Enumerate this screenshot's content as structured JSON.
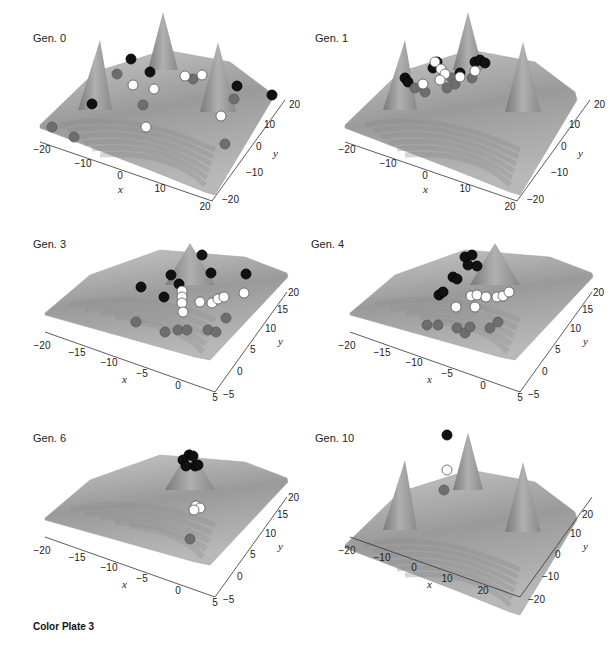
{
  "caption": "Color Plate 3",
  "panels": [
    {
      "title": "Gen. 0",
      "x_ticks": [
        "-20",
        "-10",
        "0",
        "10",
        "20"
      ],
      "y_ticks": [
        "-20",
        "-10",
        "0",
        "10",
        "20"
      ],
      "xlabel": "x",
      "ylabel": "y",
      "surface": "four-peak"
    },
    {
      "title": "Gen. 1",
      "x_ticks": [
        "-20",
        "-10",
        "0",
        "10",
        "20"
      ],
      "y_ticks": [
        "-20",
        "-10",
        "0",
        "10",
        "20"
      ],
      "xlabel": "x",
      "ylabel": "y",
      "surface": "four-peak"
    },
    {
      "title": "Gen. 3",
      "x_ticks": [
        "-20",
        "-15",
        "-10",
        "-5",
        "0",
        "5"
      ],
      "y_ticks": [
        "-5",
        "0",
        "5",
        "10",
        "15",
        "20"
      ],
      "xlabel": "x",
      "ylabel": "y",
      "surface": "zoomed-peak"
    },
    {
      "title": "Gen. 4",
      "x_ticks": [
        "-20",
        "-15",
        "-10",
        "-5",
        "0",
        "5"
      ],
      "y_ticks": [
        "-5",
        "0",
        "5",
        "10",
        "15",
        "20"
      ],
      "xlabel": "x",
      "ylabel": "y",
      "surface": "zoomed-peak"
    },
    {
      "title": "Gen. 6",
      "x_ticks": [
        "-20",
        "-15",
        "-10",
        "-5",
        "0",
        "5"
      ],
      "y_ticks": [
        "-5",
        "0",
        "5",
        "10",
        "15",
        "20"
      ],
      "xlabel": "x",
      "ylabel": "y",
      "surface": "zoomed-peak"
    },
    {
      "title": "Gen. 10",
      "x_ticks": [
        "-20",
        "-10",
        "0",
        "10",
        "20"
      ],
      "y_ticks": [
        "-20",
        "-10",
        "0",
        "10",
        "20"
      ],
      "xlabel": "x",
      "ylabel": "y",
      "surface": "four-peak"
    }
  ],
  "chart_data": [
    {
      "type": "surface-3d",
      "title": "Gen. 0",
      "xlabel": "x",
      "ylabel": "y",
      "xlim": [
        -20,
        20
      ],
      "ylim": [
        -20,
        20
      ],
      "x_ticks": [
        -20,
        -10,
        0,
        10,
        20
      ],
      "y_ticks": [
        -20,
        -10,
        0,
        10,
        20
      ],
      "series": [
        {
          "name": "black",
          "color": "#111111",
          "count": 6
        },
        {
          "name": "white",
          "color": "#ffffff",
          "count": 7
        },
        {
          "name": "gray",
          "color": "#6e6e6e",
          "count": 8
        }
      ]
    },
    {
      "type": "surface-3d",
      "title": "Gen. 1",
      "xlabel": "x",
      "ylabel": "y",
      "xlim": [
        -20,
        20
      ],
      "ylim": [
        -20,
        20
      ],
      "x_ticks": [
        -20,
        -10,
        0,
        10,
        20
      ],
      "y_ticks": [
        -20,
        -10,
        0,
        10,
        20
      ],
      "series": [
        {
          "name": "black",
          "color": "#111111",
          "count": 8
        },
        {
          "name": "white",
          "color": "#ffffff",
          "count": 8
        },
        {
          "name": "gray",
          "color": "#6e6e6e",
          "count": 6
        }
      ]
    },
    {
      "type": "surface-3d",
      "title": "Gen. 3",
      "xlabel": "x",
      "ylabel": "y",
      "xlim": [
        -20,
        5
      ],
      "ylim": [
        -5,
        20
      ],
      "x_ticks": [
        -20,
        -15,
        -10,
        -5,
        0,
        5
      ],
      "y_ticks": [
        -5,
        0,
        5,
        10,
        15,
        20
      ],
      "series": [
        {
          "name": "black",
          "color": "#111111",
          "count": 7
        },
        {
          "name": "white",
          "color": "#ffffff",
          "count": 9
        },
        {
          "name": "gray",
          "color": "#6e6e6e",
          "count": 8
        }
      ]
    },
    {
      "type": "surface-3d",
      "title": "Gen. 4",
      "xlabel": "x",
      "ylabel": "y",
      "xlim": [
        -20,
        5
      ],
      "ylim": [
        -5,
        20
      ],
      "x_ticks": [
        -20,
        -15,
        -10,
        -5,
        0,
        5
      ],
      "y_ticks": [
        -5,
        0,
        5,
        10,
        15,
        20
      ],
      "series": [
        {
          "name": "black",
          "color": "#111111",
          "count": 9
        },
        {
          "name": "white",
          "color": "#ffffff",
          "count": 9
        },
        {
          "name": "gray",
          "color": "#6e6e6e",
          "count": 8
        }
      ]
    },
    {
      "type": "surface-3d",
      "title": "Gen. 6",
      "xlabel": "x",
      "ylabel": "y",
      "xlim": [
        -20,
        5
      ],
      "ylim": [
        -5,
        20
      ],
      "x_ticks": [
        -20,
        -15,
        -10,
        -5,
        0,
        5
      ],
      "y_ticks": [
        -5,
        0,
        5,
        10,
        15,
        20
      ],
      "series": [
        {
          "name": "black",
          "color": "#111111",
          "count": 6
        },
        {
          "name": "white",
          "color": "#ffffff",
          "count": 3
        },
        {
          "name": "gray",
          "color": "#6e6e6e",
          "count": 1
        }
      ]
    },
    {
      "type": "surface-3d",
      "title": "Gen. 10",
      "xlabel": "x",
      "ylabel": "y",
      "xlim": [
        -20,
        20
      ],
      "ylim": [
        -20,
        20
      ],
      "x_ticks": [
        -20,
        -10,
        0,
        10,
        20
      ],
      "y_ticks": [
        -20,
        -10,
        0,
        10,
        20
      ],
      "series": [
        {
          "name": "black",
          "color": "#111111",
          "count": 1
        },
        {
          "name": "white",
          "color": "#ffffff",
          "count": 1
        },
        {
          "name": "gray",
          "color": "#6e6e6e",
          "count": 1
        }
      ]
    }
  ]
}
